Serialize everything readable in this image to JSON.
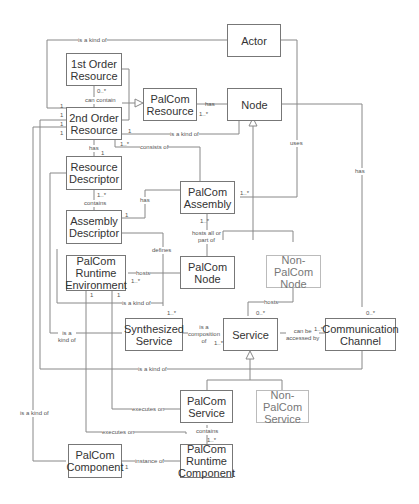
{
  "classes": {
    "actor": "Actor",
    "first_order_resource": "1st Order\nResource",
    "second_order_resource": "2nd Order\nResource",
    "palcom_resource": "PalCom\nResource",
    "node": "Node",
    "resource_descriptor": "Resource\nDescriptor",
    "palcom_assembly": "PalCom\nAssembly",
    "assembly_descriptor": "Assembly\nDescriptor",
    "palcom_runtime_environment": "PalCom\nRuntime\nEnvironment",
    "palcom_node": "PalCom\nNode",
    "non_palcom_node": "Non-\nPalCom\nNode",
    "synthesized_service": "Synthesized\nService",
    "service": "Service",
    "communication_channel": "Communication\nChannel",
    "palcom_service": "PalCom\nService",
    "non_palcom_service": "Non-\nPalCom\nService",
    "palcom_component": "PalCom\nComponent",
    "palcom_runtime_component": "PalCom\nRuntime\nComponent"
  },
  "labels": {
    "actor_is_kind_of": "is a kind of",
    "can_contain": "can contain",
    "can_contain_mult": "0..*",
    "has_resource": "has",
    "has_resource_mult": "1..*",
    "node_is_kind_of": "is a kind of",
    "node_is_kind_of_mult": "1",
    "consists_of": "consists of",
    "consists_of_mult": "1..*",
    "uses": "uses",
    "has_channel": "has",
    "has_channel_mult": "0..*",
    "has_descriptor": "has",
    "has_descriptor_mult": "1",
    "contains_descriptor": "contains",
    "contains_descriptor_mult": "1..*",
    "assembly_has": "has",
    "assembly_has_mult": "1",
    "uses_mult": "1..*",
    "hosts_all_or_part_of": "hosts all or\npart of",
    "hosts_all_mult": "1..*",
    "defines": "defines",
    "hosts_env": "hosts",
    "hosts_env_mult": "1..*",
    "env_mult_left": "1",
    "env_mult_right": "1",
    "rt_is_kind_of": "is a kind of",
    "synth_mult": "1..*",
    "synth_is_kind_of": "is a\nkind of",
    "is_composition_of": "is a\ncomposition\nof",
    "composition_mult": "1..*",
    "hosts_service": "hosts",
    "hosts_service_mult": "0..*",
    "can_be_accessed_by": "can be\naccessed by",
    "accessed_mult": "1..*",
    "channel_mult": "0..*",
    "service_is_kind_of": "is a kind of",
    "executes_on_1": "executes on",
    "executes_on_2": "executes on",
    "contains_component": "contains",
    "contains_component_mult": "1..*",
    "instance_of": "instance of",
    "instance_of_mult": "1",
    "component_is_kind_of": "is a kind of",
    "second_order_mult_1": "1",
    "second_order_mult_2": "1",
    "second_order_mult_3": "1",
    "second_order_mult_4": "1"
  }
}
